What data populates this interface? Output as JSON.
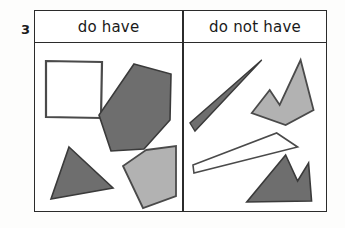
{
  "worksheet": {
    "item_number": "3",
    "header": {
      "left_label": "do have",
      "right_label": "do not have"
    },
    "colors": {
      "outline": "#2b2b2b",
      "dark_fill": "#6e6e6e",
      "light_fill": "#b2b2b2",
      "white_fill": "#ffffff",
      "page_background": "#fdfdfc",
      "text": "#1a1a1a"
    },
    "columns": [
      {
        "id": "do-have",
        "label": "do have",
        "shapes": [
          {
            "name": "white-square",
            "kind": "square",
            "fill": "white",
            "points": "11,18 67,19 66,75 11,74"
          },
          {
            "name": "dark-hexagon",
            "kind": "hexagon",
            "fill": "dark",
            "points": "99,21 136,31 135,77 109,106 76,108 64,72"
          },
          {
            "name": "dark-triangle",
            "kind": "triangle",
            "fill": "dark",
            "points": "34,104 78,145 16,156"
          },
          {
            "name": "light-pentagon",
            "kind": "pentagon",
            "fill": "light",
            "points": "111,107 141,103 141,153 108,165 88,123"
          }
        ]
      },
      {
        "id": "do-not-have",
        "label": "do not have",
        "shapes": [
          {
            "name": "dark-sliver-triangle",
            "kind": "triangle",
            "fill": "dark",
            "points": "78,17 6,80 11,88"
          },
          {
            "name": "light-crown-polygon",
            "kind": "crown",
            "fill": "light",
            "points": "86,47 96,62 117,17 130,67 102,82 68,70"
          },
          {
            "name": "white-sliver-quadrilateral",
            "kind": "quadrilateral",
            "fill": "white",
            "points": "93,90 114,104 10,130 9,122"
          },
          {
            "name": "dark-mountain-polygon",
            "kind": "mountain",
            "fill": "dark",
            "points": "102,112 114,138 125,120 128,158 63,159"
          }
        ]
      }
    ]
  }
}
